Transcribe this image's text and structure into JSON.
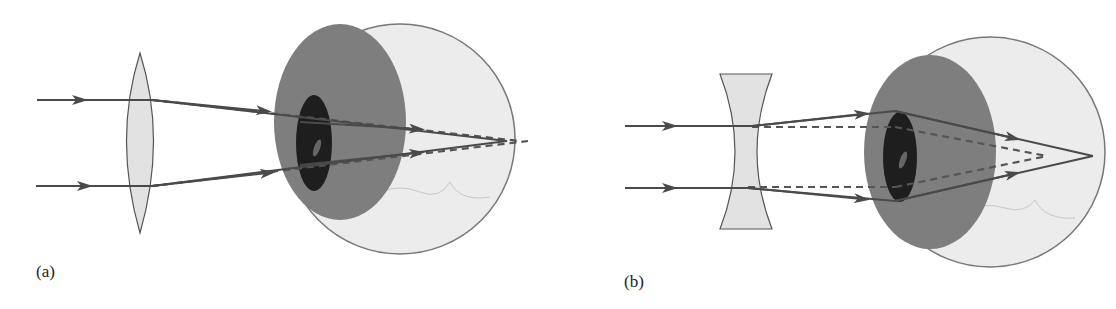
{
  "figure": {
    "panels": [
      {
        "id": "a",
        "label": "(a)",
        "lens": "converging (convex) lens",
        "condition": "hyperopia correction"
      },
      {
        "id": "b",
        "label": "(b)",
        "lens": "diverging (concave) lens",
        "condition": "myopia correction"
      }
    ],
    "colors": {
      "ray": "#4a4a4a",
      "dashed_ray": "#555555",
      "lens_fill": "#e2e2e2",
      "eyeball_fill": "#ececec",
      "iris_fill": "#7a7a7a",
      "pupil_fill": "#1e1e1e"
    }
  }
}
